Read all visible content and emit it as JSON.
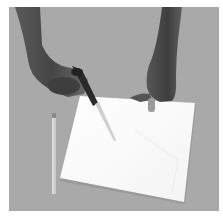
{
  "image": {
    "description": "Grayscale photograph of two hands cutting a sheet of white paper with scissors on a gray table, a pencil lying to the left",
    "colors": {
      "margin": "#ffffff",
      "background": "#a8a8a8",
      "paper": "#fdfdfd",
      "skin_dark": "#4a4a4a",
      "skin_mid": "#6e6e6e",
      "scissors": "#2a2a2a",
      "blade": "#d4d4d4",
      "pencil": "#c8c8c8"
    },
    "objects": [
      "left-hand-with-scissors",
      "right-hand-holding-paper",
      "paper-sheet",
      "pencil"
    ]
  }
}
